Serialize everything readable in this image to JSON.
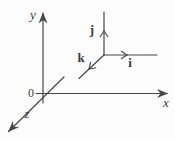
{
  "figure": {
    "colors": {
      "line": "#474747",
      "background": "#fdfdfd",
      "label": "#3a3a3a"
    },
    "axes": {
      "origin_label": "0",
      "x_label": "x",
      "y_label": "y",
      "z_label": "z"
    },
    "unit_vectors": {
      "i_label": "i",
      "j_label": "j",
      "k_label": "k"
    }
  }
}
